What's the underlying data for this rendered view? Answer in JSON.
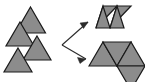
{
  "canvas": {
    "width": 145,
    "height": 82,
    "background": "#ffffff"
  },
  "style": {
    "triangle_fill": "#8c8c8c",
    "triangle_stroke": "#1a1a1a",
    "triangle_stroke_width": 1.2,
    "arrow_color": "#2b2b2b",
    "arrow_stroke_width": 1.1
  },
  "diagram": {
    "left_group_label": "loose triangles",
    "right_top_label": "parallelogram",
    "right_bottom_label": "arrowhead arrangement",
    "arrow_count": 2
  },
  "left_triangles": [
    {
      "name": "triangle-top-right",
      "points": "30.5,7 45.5,33 15.5,33",
      "orientation": "up"
    },
    {
      "name": "triangle-upper-left",
      "points": "20,22 34,46 6,46",
      "orientation": "up"
    },
    {
      "name": "triangle-middle-right",
      "points": "37,36 51,60 23,60",
      "orientation": "up"
    },
    {
      "name": "triangle-lower-left",
      "points": "18,48 32,72 4,72",
      "orientation": "up"
    }
  ],
  "right_top_shape": {
    "name": "parallelogram-group",
    "triangles": [
      {
        "name": "para-tri-1",
        "points": "96,28 103,6 117,6",
        "orientation": "down"
      },
      {
        "name": "para-tri-2",
        "points": "96,28 110,28 103,6",
        "orientation": "up"
      },
      {
        "name": "para-tri-3",
        "points": "110,28 117,6 131,6",
        "orientation": "down"
      },
      {
        "name": "para-tri-4",
        "points": "110,28 124,28 117,6",
        "orientation": "up"
      }
    ],
    "outline": "96,28 103,6 145,6 138,28"
  },
  "right_bottom_shape": {
    "name": "arrowhead-group",
    "triangles": [
      {
        "name": "arrow-tri-left",
        "points": "89,66 103,42 117,66",
        "orientation": "up"
      },
      {
        "name": "arrow-tri-middle",
        "points": "103,42 131,42 117,66",
        "orientation": "down"
      },
      {
        "name": "arrow-tri-right",
        "points": "117,66 131,42 145,66",
        "orientation": "up"
      },
      {
        "name": "arrow-tri-hanging",
        "points": "117,66 145,66 131,90",
        "orientation": "down"
      }
    ]
  },
  "arrows": [
    {
      "name": "arrow-to-parallelogram",
      "line": "62,45 88,22",
      "head": "88,22 80,23 83.5,28.5",
      "direction": "up-right"
    },
    {
      "name": "arrow-to-arrowhead",
      "line": "62,45 86,59",
      "head": "86,59 77.5,57.5 80,63.5",
      "direction": "down-right"
    }
  ]
}
